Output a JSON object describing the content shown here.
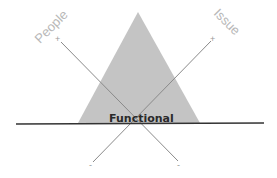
{
  "diagram": {
    "center_label": "Functional",
    "axes": [
      {
        "name": "People",
        "positive_sign": "+",
        "negative_sign": "-"
      },
      {
        "name": "Issue",
        "positive_sign": "+",
        "negative_sign": "-"
      }
    ],
    "colors": {
      "triangle_fill": "#c4c4c4",
      "baseline": "#333333",
      "axis_line": "#8a8a8a",
      "label_text": "#b8b8b8",
      "center_text": "#2a2a2a"
    }
  }
}
